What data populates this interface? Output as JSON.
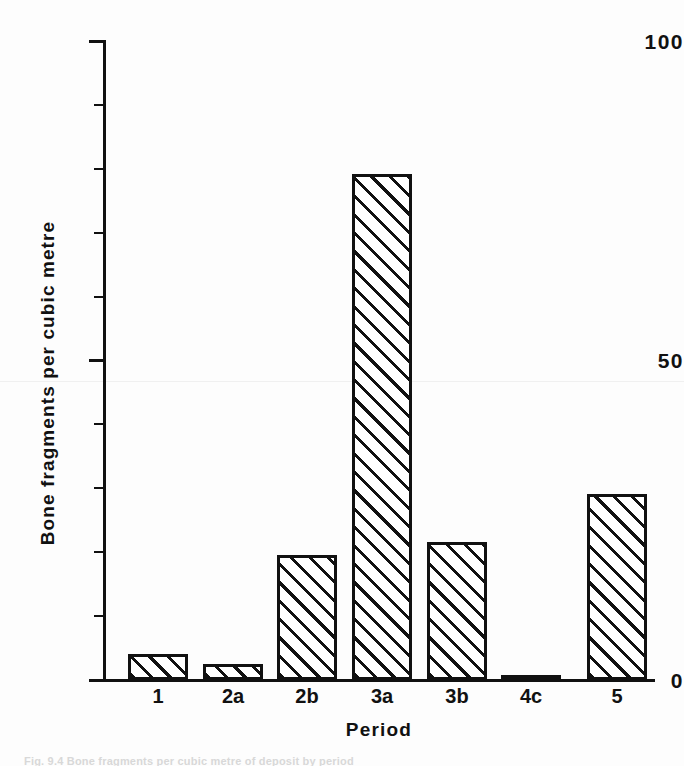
{
  "chart_data": {
    "type": "bar",
    "title": "",
    "subtitle": "",
    "xlabel": "Period",
    "ylabel": "Bone fragments per cubic metre",
    "categories": [
      "1",
      "2a",
      "2b",
      "3a",
      "3b",
      "4c",
      "5"
    ],
    "values": [
      4,
      2.5,
      19.5,
      79,
      21.5,
      0.8,
      29
    ],
    "ylim": [
      0,
      100
    ],
    "y_major_ticks": [
      0,
      50,
      100
    ],
    "y_major_tick_labels": [
      "0",
      "50",
      "100"
    ],
    "y_minor_ticks": [
      10,
      20,
      30,
      40,
      60,
      70,
      80,
      90
    ],
    "grid": false,
    "legend": null,
    "bar_style": "diagonal-hatch",
    "colors": {
      "ink": "#111111",
      "background": "#ffffff",
      "bar_fill": "#ffffff",
      "hatch": "#111111"
    }
  },
  "figure": {
    "caption_fragment": "Fig. 9.4  Bone fragments per cubic metre of deposit by period"
  }
}
